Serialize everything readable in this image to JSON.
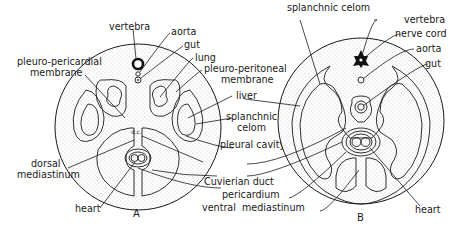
{
  "figure": {
    "panels": [
      {
        "id": "A",
        "letter": "A",
        "labels": {
          "vertebra": "vertebra",
          "aorta": "aorta",
          "gut": "gut",
          "lung": "lung",
          "pleuro_pericardial_1": "pleuro-pericardial",
          "pleuro_pericardial_2": "membrane",
          "pleuro_peritoneal_1": "pleuro-peritoneal",
          "pleuro_peritoneal_2": "membrane",
          "liver": "liver",
          "splanchnic_celom_1": "splanchnic",
          "splanchnic_celom_2": "celom",
          "pleural_cavity": "pleural cavity",
          "dorsal_mediastinum_1": "dorsal",
          "dorsal_mediastinum_2": "mediastinum",
          "cuvierian_duct": "Cuvierian duct",
          "pericardium": "pericardium",
          "ventral_mediastinum": "ventral  mediastinum",
          "heart": "heart",
          "dc_annotation": "d.c."
        }
      },
      {
        "id": "B",
        "letter": "B",
        "labels": {
          "splanchnic_celom": "splanchnic celom",
          "vertebra": "vertebra",
          "nerve_cord": "nerve cord",
          "aorta": "aorta",
          "gut": "gut",
          "dorsal_mediastinum_1": "dorsal",
          "dorsal_mediastinum_2": "mediastinum",
          "heart": "heart"
        }
      }
    ],
    "colors": {
      "ink": "#1a1a1a",
      "stipple": "#bdbdbd",
      "background": "#ffffff"
    }
  }
}
